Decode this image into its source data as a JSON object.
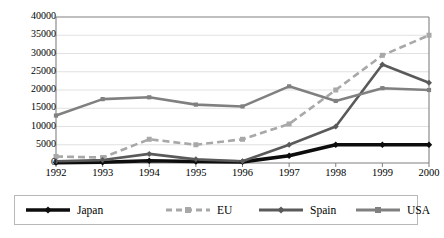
{
  "chart_data": {
    "type": "line",
    "title": "",
    "subtitle": "",
    "xlabel": "",
    "ylabel": "",
    "categories": [
      "1992",
      "1993",
      "1994",
      "1995",
      "1996",
      "1997",
      "1998",
      "1999",
      "2000"
    ],
    "x": [
      1992,
      1993,
      1994,
      1995,
      1996,
      1997,
      1998,
      1999,
      2000
    ],
    "ylim": [
      0,
      40000
    ],
    "xlim": [
      1992,
      2000
    ],
    "yticks": [
      0,
      5000,
      10000,
      15000,
      20000,
      25000,
      30000,
      35000,
      40000
    ],
    "ytick_labels": [
      "0",
      "5000",
      "10000",
      "15000",
      "20000",
      "25000",
      "30000",
      "35000",
      "40000"
    ],
    "grid": true,
    "grid_axis": "y",
    "legend_position": "bottom",
    "series": [
      {
        "name": "Japan",
        "values": [
          100,
          200,
          600,
          400,
          300,
          2000,
          5000,
          5000,
          5000
        ],
        "color": "#0d0d0d",
        "style": "solid-thick",
        "marker": "diamond"
      },
      {
        "name": "EU",
        "values": [
          1800,
          1500,
          6500,
          5000,
          6500,
          10700,
          20000,
          29500,
          35000
        ],
        "color": "#a8a8a8",
        "style": "dashed",
        "marker": "square"
      },
      {
        "name": "Spain",
        "values": [
          500,
          800,
          2500,
          1000,
          500,
          5000,
          10000,
          27000,
          22000
        ],
        "color": "#5a5a5a",
        "style": "solid",
        "marker": "diamond"
      },
      {
        "name": "USA",
        "values": [
          13000,
          17500,
          18000,
          16000,
          15500,
          21000,
          17000,
          20500,
          20000
        ],
        "color": "#808080",
        "style": "solid",
        "marker": "square"
      }
    ]
  },
  "legend": {
    "entries": [
      {
        "label": "Japan",
        "color": "#0d0d0d",
        "style": "solid-thick",
        "marker": "diamond"
      },
      {
        "label": "EU",
        "color": "#a8a8a8",
        "style": "dashed",
        "marker": "square"
      },
      {
        "label": "Spain",
        "color": "#5a5a5a",
        "style": "solid",
        "marker": "diamond"
      },
      {
        "label": "USA",
        "color": "#808080",
        "style": "solid",
        "marker": "square"
      }
    ]
  },
  "colors": {
    "background": "#ffffff",
    "axis": "#808080",
    "gridline": "#d9d9d9",
    "text": "#000000",
    "legend_border": "#b8b8b8"
  }
}
